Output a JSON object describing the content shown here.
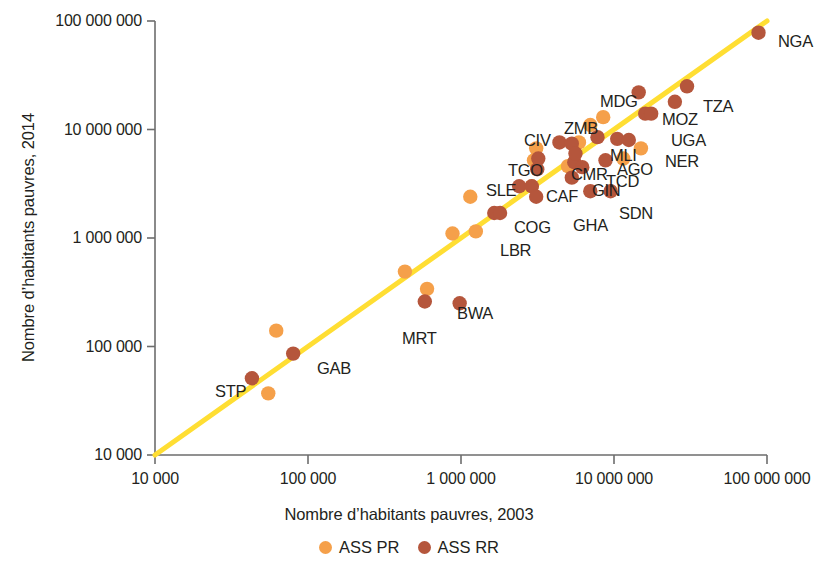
{
  "chart_data": {
    "type": "scatter",
    "title": "",
    "xlabel": "Nombre d’habitants pauvres, 2003",
    "ylabel": "Nombre d’habitants pauvres, 2014",
    "xscale": "log",
    "yscale": "log",
    "xlim": [
      10000,
      100000000
    ],
    "ylim": [
      10000,
      100000000
    ],
    "grid": false,
    "xticks": [
      {
        "value": 10000,
        "label": "10 000"
      },
      {
        "value": 100000,
        "label": "100 000"
      },
      {
        "value": 1000000,
        "label": "1 000 000"
      },
      {
        "value": 10000000,
        "label": "10 000 000"
      },
      {
        "value": 100000000,
        "label": "100 000 000"
      }
    ],
    "yticks": [
      {
        "value": 10000,
        "label": "10 000"
      },
      {
        "value": 100000,
        "label": "100 000"
      },
      {
        "value": 1000000,
        "label": "1 000 000"
      },
      {
        "value": 10000000,
        "label": "10 000 000"
      },
      {
        "value": 100000000,
        "label": "100 000 000"
      }
    ],
    "reference_line": {
      "name": "identity-line-45deg",
      "from": [
        10000,
        10000
      ],
      "to": [
        100000000,
        100000000
      ],
      "color": "#FFDE33"
    },
    "legend": {
      "position": "bottom-center",
      "entries": [
        {
          "name": "ASS PR",
          "color": "#F5A04A"
        },
        {
          "name": "ASS RR",
          "color": "#B5563C"
        }
      ]
    },
    "series": [
      {
        "name": "ASS PR",
        "color": "#F5A04A",
        "points": [
          {
            "x": 55000,
            "y": 37000
          },
          {
            "x": 62000,
            "y": 140000
          },
          {
            "x": 600000,
            "y": 340000
          },
          {
            "x": 430000,
            "y": 490000
          },
          {
            "x": 880000,
            "y": 1100000
          },
          {
            "x": 1250000,
            "y": 1150000
          },
          {
            "x": 1150000,
            "y": 2400000
          },
          {
            "x": 2900000,
            "y": 3000000
          },
          {
            "x": 3000000,
            "y": 5200000
          },
          {
            "x": 3100000,
            "y": 6700000
          },
          {
            "x": 5000000,
            "y": 4600000
          },
          {
            "x": 5900000,
            "y": 7600000
          },
          {
            "x": 7000000,
            "y": 11000000
          },
          {
            "x": 8500000,
            "y": 13000000
          },
          {
            "x": 11500000,
            "y": 5400000
          },
          {
            "x": 15000000,
            "y": 6700000
          }
        ]
      },
      {
        "name": "ASS RR",
        "color": "#B5563C",
        "points": [
          {
            "x": 43000,
            "y": 51000
          },
          {
            "x": 80000,
            "y": 86000
          },
          {
            "x": 580000,
            "y": 260000
          },
          {
            "x": 980000,
            "y": 250000
          },
          {
            "x": 1650000,
            "y": 1700000
          },
          {
            "x": 1800000,
            "y": 1700000
          },
          {
            "x": 2400000,
            "y": 3000000
          },
          {
            "x": 2900000,
            "y": 3000000
          },
          {
            "x": 3100000,
            "y": 2400000
          },
          {
            "x": 3150000,
            "y": 4300000
          },
          {
            "x": 3200000,
            "y": 5400000
          },
          {
            "x": 4400000,
            "y": 7600000
          },
          {
            "x": 5300000,
            "y": 7400000
          },
          {
            "x": 5300000,
            "y": 3600000
          },
          {
            "x": 5500000,
            "y": 5000000
          },
          {
            "x": 5600000,
            "y": 6000000
          },
          {
            "x": 6200000,
            "y": 4500000
          },
          {
            "x": 7000000,
            "y": 2700000
          },
          {
            "x": 7800000,
            "y": 8500000
          },
          {
            "x": 8800000,
            "y": 5200000
          },
          {
            "x": 9500000,
            "y": 2700000
          },
          {
            "x": 10500000,
            "y": 8200000
          },
          {
            "x": 12500000,
            "y": 8000000
          },
          {
            "x": 14500000,
            "y": 22000000
          },
          {
            "x": 16000000,
            "y": 14000000
          },
          {
            "x": 17500000,
            "y": 14000000
          },
          {
            "x": 25000000,
            "y": 18000000
          },
          {
            "x": 30000000,
            "y": 25000000
          },
          {
            "x": 88000000,
            "y": 78000000
          }
        ]
      }
    ],
    "annotations": [
      {
        "text": "NGA",
        "x": 778,
        "y": 32
      },
      {
        "text": "MDG",
        "x": 600,
        "y": 92
      },
      {
        "text": "TZA",
        "x": 703,
        "y": 97
      },
      {
        "text": "MOZ",
        "x": 662,
        "y": 110
      },
      {
        "text": "UGA",
        "x": 671,
        "y": 131
      },
      {
        "text": "NER",
        "x": 665,
        "y": 152
      },
      {
        "text": "ZMB",
        "x": 564,
        "y": 119
      },
      {
        "text": "CIV",
        "x": 524,
        "y": 131
      },
      {
        "text": "MLI",
        "x": 610,
        "y": 146
      },
      {
        "text": "AGO",
        "x": 617,
        "y": 160
      },
      {
        "text": "TCD",
        "x": 606,
        "y": 172
      },
      {
        "text": "CMR",
        "x": 571,
        "y": 165
      },
      {
        "text": "TGO",
        "x": 508,
        "y": 161
      },
      {
        "text": "SLE",
        "x": 486,
        "y": 181
      },
      {
        "text": "CAF",
        "x": 546,
        "y": 187
      },
      {
        "text": "GIN",
        "x": 592,
        "y": 181
      },
      {
        "text": "SDN",
        "x": 619,
        "y": 204
      },
      {
        "text": "GHA",
        "x": 573,
        "y": 216
      },
      {
        "text": "COG",
        "x": 514,
        "y": 218
      },
      {
        "text": "LBR",
        "x": 500,
        "y": 241
      },
      {
        "text": "BWA",
        "x": 457,
        "y": 304
      },
      {
        "text": "MRT",
        "x": 402,
        "y": 329
      },
      {
        "text": "GAB",
        "x": 317,
        "y": 359
      },
      {
        "text": "STP",
        "x": 215,
        "y": 382
      }
    ]
  },
  "axes": {
    "axis_color": "#6d6d6d",
    "plot_left": 155,
    "plot_right": 767,
    "plot_top": 21,
    "plot_bottom": 455
  }
}
